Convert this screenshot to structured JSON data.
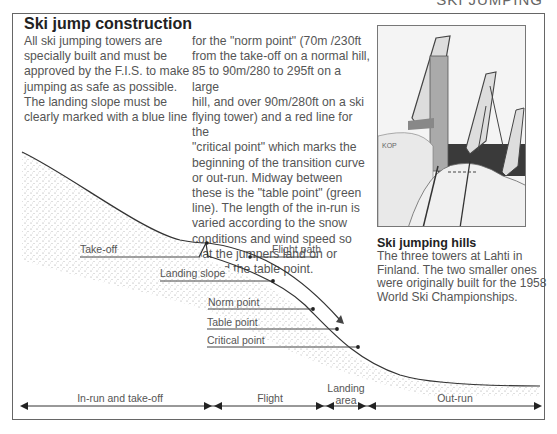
{
  "header": {
    "section_tag": "SKI JUMPING"
  },
  "article": {
    "title": "Ski jump construction",
    "column1": "All ski jumping towers are\nspecially built and must be\napproved by the F.I.S. to make\njumping as safe as possible.\nThe landing slope must be\nclearly marked with a blue line",
    "column2": "for the \"norm point\" (70m /230ft\nfrom the take-off on a normal hill,\n85 to 90m/280 to 295ft on a large\nhill, and over 90m/280ft on a ski\nflying tower) and a red line for the\n\"critical point\" which marks the\nbeginning of the transition curve\nor out-run. Midway between\nthese is the \"table point\" (green\nline). The length of the in-run is\nvaried according to the snow\nconditions and wind speed so\nthat the jumpers land on or\naround the table point."
  },
  "photo": {
    "alt": "Three ski jumping towers at Lahti",
    "caption_title": "Ski jumping hills",
    "caption_text": "The three towers at Lahti in\nFinland. The two smaller ones\nwere originally built for the 1958\nWorld Ski Championships."
  },
  "diagram": {
    "labels": {
      "take_off": "Take-off",
      "flight_path": "Flight path",
      "landing_slope": "Landing slope",
      "norm_point": "Norm point",
      "table_point": "Table point",
      "critical_point": "Critical point"
    },
    "segments": [
      {
        "label": "In-run and take-off"
      },
      {
        "label": "Flight"
      },
      {
        "label": "Landing\narea"
      },
      {
        "label": "Out-run"
      }
    ],
    "colors": {
      "line": "#333333",
      "stipple": "#999999"
    }
  }
}
